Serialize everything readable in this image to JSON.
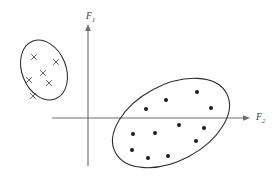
{
  "figure": {
    "background_color": "#ffffff",
    "width": 274,
    "height": 177
  },
  "axes": {
    "vertical": {
      "label": "F",
      "subscript": "1",
      "color": "#6e6e6e",
      "x": 88,
      "y_top": 25,
      "y_bottom": 166,
      "arrow": "up"
    },
    "horizontal": {
      "label": "F",
      "subscript": "2",
      "color": "#6e6e6e",
      "y": 118,
      "x_left": 52,
      "x_right": 249,
      "arrow": "right"
    }
  },
  "chart_data": {
    "type": "scatter",
    "xlabel": "F2",
    "ylabel": "F1",
    "grid": false,
    "legend": "none",
    "origin_px": {
      "x": 88,
      "y": 118
    },
    "series": [
      {
        "name": "class-x-cluster",
        "marker": "x",
        "marker_color": "#4a4a4a",
        "count": 6,
        "points_px": [
          {
            "x": 34,
            "y": 57
          },
          {
            "x": 56,
            "y": 62
          },
          {
            "x": 43,
            "y": 73
          },
          {
            "x": 29,
            "y": 80
          },
          {
            "x": 49,
            "y": 83
          },
          {
            "x": 33,
            "y": 96
          }
        ],
        "outline": {
          "shape": "ellipse",
          "cx": 44,
          "cy": 70,
          "rx": 22,
          "ry": 31,
          "rotation_deg": -22,
          "stroke": "#2b2b2b"
        }
      },
      {
        "name": "class-dot-cluster",
        "marker": "dot",
        "marker_color": "#1c1c1c",
        "count": 12,
        "points_px": [
          {
            "x": 197,
            "y": 92
          },
          {
            "x": 166,
            "y": 100
          },
          {
            "x": 211,
            "y": 108
          },
          {
            "x": 146,
            "y": 109
          },
          {
            "x": 179,
            "y": 125
          },
          {
            "x": 204,
            "y": 128
          },
          {
            "x": 133,
            "y": 134
          },
          {
            "x": 155,
            "y": 133
          },
          {
            "x": 196,
            "y": 141
          },
          {
            "x": 132,
            "y": 150
          },
          {
            "x": 148,
            "y": 158
          },
          {
            "x": 168,
            "y": 156
          }
        ],
        "outline": {
          "shape": "ellipse",
          "cx": 171,
          "cy": 123,
          "rx": 63,
          "ry": 38,
          "rotation_deg": -28,
          "stroke": "#2b2b2b"
        }
      }
    ]
  }
}
